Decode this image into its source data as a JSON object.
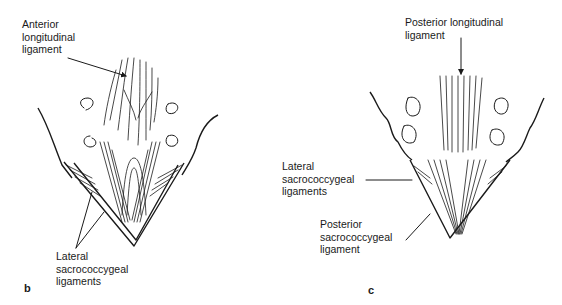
{
  "figure": {
    "panel_b": {
      "letter": "b",
      "labels": {
        "anterior_longitudinal": "Anterior\nlongitudinal\nligament",
        "lateral_sacrococcygeal": "Lateral\nsacrococcygeal\nligaments"
      }
    },
    "panel_c": {
      "letter": "c",
      "labels": {
        "posterior_longitudinal": "Posterior longitudinal\nligament",
        "lateral_sacrococcygeal": "Lateral\nsacrococcygeal\nligaments",
        "posterior_sacrococcygeal": "Posterior\nsacrococcygeal\nligament"
      }
    }
  }
}
